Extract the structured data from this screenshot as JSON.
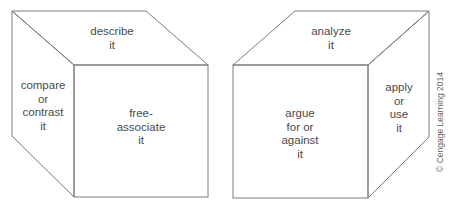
{
  "diagram": {
    "type": "cubing-strategy-cubes",
    "line_color": "#7a7a7a",
    "text_color": "#4a4a4a",
    "cubes": [
      {
        "id": "left-cube",
        "faces": {
          "top": [
            "describe",
            "it"
          ],
          "left": [
            "compare",
            "or",
            "contrast",
            "it"
          ],
          "front": [
            "free-",
            "associate",
            "it"
          ]
        }
      },
      {
        "id": "right-cube",
        "faces": {
          "top": [
            "analyze",
            "it"
          ],
          "front": [
            "argue",
            "for or",
            "against",
            "it"
          ],
          "right": [
            "apply",
            "or",
            "use",
            "it"
          ]
        }
      }
    ],
    "credit": "© Cengage Learning 2014"
  }
}
